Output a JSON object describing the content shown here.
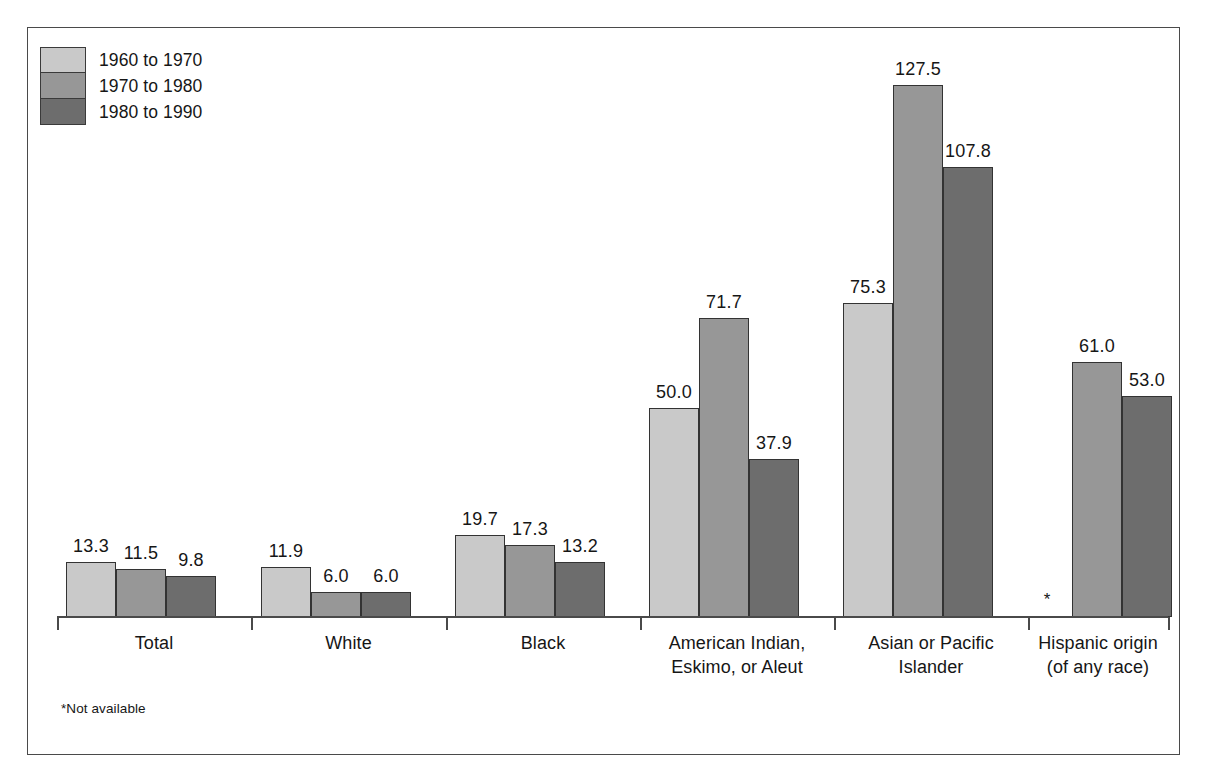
{
  "figure": {
    "background_color": "#ffffff",
    "border_color": "#4a4a4a"
  },
  "legend": {
    "position": "top-left",
    "items": [
      {
        "label": "1960 to 1970",
        "color": "#c9c9c9",
        "swatch_name": "legend-swatch-1960-1970"
      },
      {
        "label": "1970 to 1980",
        "color": "#979797",
        "swatch_name": "legend-swatch-1970-1980"
      },
      {
        "label": "1980 to 1990",
        "color": "#6d6d6d",
        "swatch_name": "legend-swatch-1980-1990"
      }
    ]
  },
  "footnote": "*Not available",
  "na_symbol": "*",
  "chart_data": {
    "type": "bar",
    "title": "",
    "subtitle": "",
    "xlabel": "",
    "ylabel": "",
    "grid": false,
    "legend_position": "top-left",
    "axis_visible": "baseline-only",
    "ylim": [
      0,
      136
    ],
    "value_label_format": "one-decimal",
    "categories": [
      "Total",
      "White",
      "Black",
      "American Indian,\nEskimo, or Aleut",
      "Asian or Pacific\nIslander",
      "Hispanic origin\n(of any race)"
    ],
    "category_lines": [
      [
        "Total"
      ],
      [
        "White"
      ],
      [
        "Black"
      ],
      [
        "American Indian,",
        "Eskimo, or Aleut"
      ],
      [
        "Asian or Pacific",
        "Islander"
      ],
      [
        "Hispanic origin",
        "(of any race)"
      ]
    ],
    "series": [
      {
        "name": "1960 to 1970",
        "color": "#c9c9c9",
        "values": [
          13.3,
          11.9,
          19.7,
          50.0,
          75.3,
          null
        ],
        "labels": [
          "13.3",
          "11.9",
          "19.7",
          "50.0",
          "75.3",
          "*"
        ]
      },
      {
        "name": "1970 to 1980",
        "color": "#979797",
        "values": [
          11.5,
          6.0,
          17.3,
          71.7,
          127.5,
          61.0
        ],
        "labels": [
          "11.5",
          "6.0",
          "17.3",
          "71.7",
          "127.5",
          "61.0"
        ]
      },
      {
        "name": "1980 to 1990",
        "color": "#6d6d6d",
        "values": [
          9.8,
          6.0,
          13.2,
          37.9,
          107.8,
          53.0
        ],
        "labels": [
          "9.8",
          "6.0",
          "13.2",
          "37.9",
          "107.8",
          "53.0"
        ]
      }
    ]
  }
}
